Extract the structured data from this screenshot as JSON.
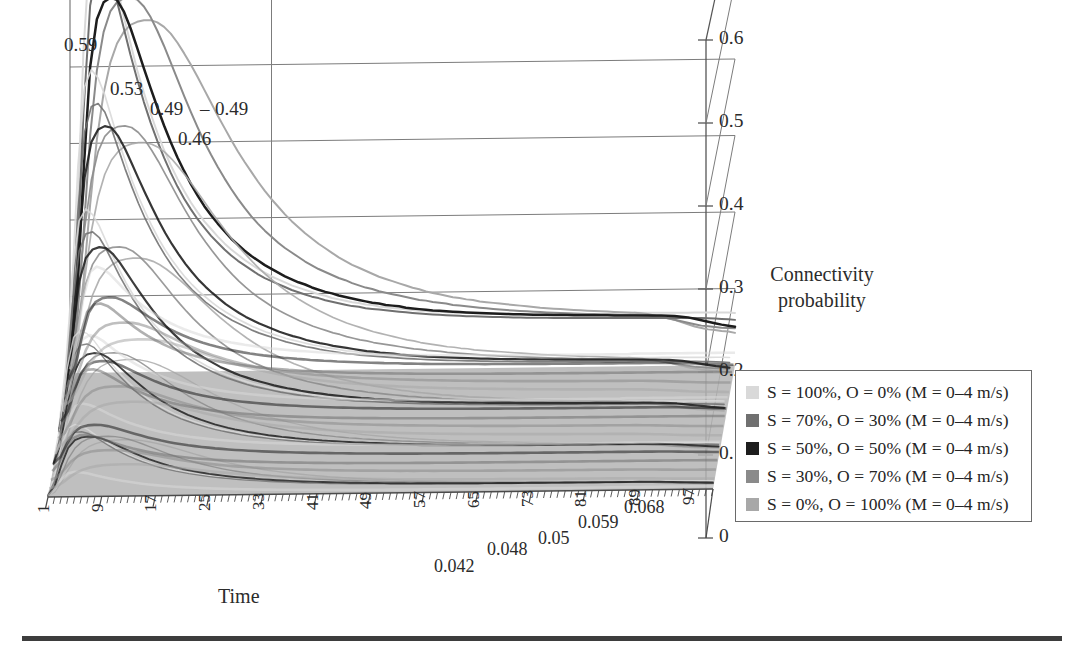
{
  "chart_data": {
    "type": "line",
    "title": "",
    "subtitle": "",
    "xlabel": "Time",
    "ylabel": "Connectivity probability",
    "zlabel": "",
    "projection": "3d-ribbon",
    "grid": true,
    "legend_position": "right",
    "ylim": [
      0,
      0.6
    ],
    "yticks": [
      "0",
      "0.1",
      "0.2",
      "0.3",
      "0.4",
      "0.5",
      "0.6"
    ],
    "ytick_values": [
      0,
      0.1,
      0.2,
      0.3,
      0.4,
      0.5,
      0.6
    ],
    "xticks": [
      "1",
      "9",
      "17",
      "25",
      "33",
      "41",
      "49",
      "57",
      "65",
      "73",
      "81",
      "89",
      "97"
    ],
    "xtick_values": [
      1,
      9,
      17,
      25,
      33,
      41,
      49,
      57,
      65,
      73,
      81,
      89,
      97
    ],
    "xlim": [
      1,
      100
    ],
    "peak_labels": [
      "0.59",
      "0.53",
      "0.49",
      "0.49",
      "0.46"
    ],
    "end_labels": [
      "0.042",
      "0.048",
      "0.05",
      "0.059",
      "0.068"
    ],
    "series": [
      {
        "name": "S = 100%, O = 0% (M = 0-4 m/s)",
        "color": "#d9d9d9",
        "peak": 0.59,
        "peak_time": 5,
        "end_value": 0.068,
        "values": [
          0.02,
          0.18,
          0.42,
          0.56,
          0.59,
          0.575,
          0.545,
          0.505,
          0.465,
          0.43,
          0.395,
          0.365,
          0.338,
          0.313,
          0.29,
          0.27,
          0.252,
          0.236,
          0.221,
          0.208,
          0.196,
          0.186,
          0.176,
          0.167,
          0.159,
          0.152,
          0.145,
          0.139,
          0.133,
          0.128,
          0.123,
          0.119,
          0.115,
          0.111,
          0.108,
          0.105,
          0.102,
          0.099,
          0.097,
          0.094,
          0.092,
          0.09,
          0.088,
          0.087,
          0.085,
          0.084,
          0.082,
          0.081,
          0.08,
          0.079,
          0.078,
          0.077,
          0.076,
          0.0755,
          0.0748,
          0.0742,
          0.0736,
          0.0731,
          0.0726,
          0.0721,
          0.0717,
          0.0713,
          0.0709,
          0.0706,
          0.0703,
          0.07,
          0.0697,
          0.0694,
          0.0692,
          0.069,
          0.0688,
          0.0686,
          0.0684,
          0.0682,
          0.0681,
          0.0679,
          0.0678,
          0.0677,
          0.0676,
          0.0675,
          0.0674,
          0.0673,
          0.0672,
          0.0671,
          0.0701,
          0.0699,
          0.0698,
          0.0697,
          0.0696,
          0.0695,
          0.0694,
          0.0693,
          0.0692,
          0.0691,
          0.069,
          0.0689,
          0.0688,
          0.0687,
          0.0686,
          0.068
        ]
      },
      {
        "name": "S = 70%, O = 30% (M = 0-4 m/s)",
        "color": "#707070",
        "peak": 0.53,
        "peak_time": 6,
        "end_value": 0.059,
        "values": [
          0.015,
          0.13,
          0.34,
          0.48,
          0.525,
          0.53,
          0.515,
          0.485,
          0.45,
          0.415,
          0.383,
          0.353,
          0.326,
          0.302,
          0.28,
          0.26,
          0.242,
          0.226,
          0.212,
          0.199,
          0.188,
          0.177,
          0.168,
          0.159,
          0.151,
          0.144,
          0.138,
          0.132,
          0.126,
          0.121,
          0.117,
          0.113,
          0.109,
          0.105,
          0.102,
          0.099,
          0.096,
          0.094,
          0.091,
          0.089,
          0.087,
          0.085,
          0.083,
          0.082,
          0.08,
          0.079,
          0.078,
          0.077,
          0.076,
          0.075,
          0.074,
          0.073,
          0.0722,
          0.0715,
          0.0708,
          0.0702,
          0.0696,
          0.0691,
          0.0686,
          0.0681,
          0.0677,
          0.0673,
          0.0669,
          0.0666,
          0.0663,
          0.066,
          0.0657,
          0.0654,
          0.0652,
          0.065,
          0.0648,
          0.0646,
          0.0644,
          0.0642,
          0.0641,
          0.0639,
          0.0638,
          0.0637,
          0.0636,
          0.0635,
          0.0634,
          0.0633,
          0.0632,
          0.0631,
          0.063,
          0.0629,
          0.0628,
          0.0627,
          0.0626,
          0.0625,
          0.0624,
          0.0623,
          0.0622,
          0.0621,
          0.062,
          0.0615,
          0.061,
          0.0605,
          0.06,
          0.059
        ]
      },
      {
        "name": "S = 50%, O = 50% (M = 0-4 m/s)",
        "color": "#1d1d1d",
        "peak": 0.49,
        "peak_time": 8,
        "end_value": 0.05,
        "values": [
          0.01,
          0.09,
          0.26,
          0.4,
          0.462,
          0.484,
          0.49,
          0.487,
          0.472,
          0.45,
          0.424,
          0.397,
          0.371,
          0.346,
          0.322,
          0.3,
          0.28,
          0.262,
          0.245,
          0.23,
          0.216,
          0.204,
          0.193,
          0.183,
          0.173,
          0.165,
          0.157,
          0.15,
          0.144,
          0.138,
          0.133,
          0.128,
          0.123,
          0.119,
          0.115,
          0.112,
          0.108,
          0.105,
          0.102,
          0.1,
          0.097,
          0.095,
          0.093,
          0.091,
          0.089,
          0.087,
          0.086,
          0.084,
          0.083,
          0.082,
          0.08,
          0.079,
          0.078,
          0.077,
          0.076,
          0.0755,
          0.0748,
          0.0741,
          0.0735,
          0.0729,
          0.0724,
          0.0719,
          0.0714,
          0.071,
          0.0706,
          0.0702,
          0.0699,
          0.0696,
          0.0693,
          0.069,
          0.0687,
          0.0685,
          0.0683,
          0.0681,
          0.0679,
          0.0677,
          0.0675,
          0.0673,
          0.0672,
          0.067,
          0.0669,
          0.0667,
          0.0666,
          0.0665,
          0.0664,
          0.0663,
          0.0662,
          0.0661,
          0.066,
          0.0655,
          0.065,
          0.064,
          0.063,
          0.061,
          0.059,
          0.057,
          0.055,
          0.053,
          0.0515,
          0.05
        ]
      },
      {
        "name": "S = 30%, O = 70% (M = 0-4 m/s)",
        "color": "#8a8a8a",
        "peak": 0.49,
        "peak_time": 11,
        "end_value": 0.048,
        "values": [
          0.008,
          0.06,
          0.18,
          0.31,
          0.395,
          0.445,
          0.472,
          0.484,
          0.489,
          0.49,
          0.487,
          0.478,
          0.464,
          0.446,
          0.426,
          0.404,
          0.382,
          0.36,
          0.339,
          0.319,
          0.3,
          0.283,
          0.267,
          0.252,
          0.238,
          0.225,
          0.213,
          0.202,
          0.192,
          0.183,
          0.175,
          0.167,
          0.16,
          0.154,
          0.148,
          0.142,
          0.137,
          0.132,
          0.128,
          0.124,
          0.12,
          0.117,
          0.113,
          0.11,
          0.107,
          0.105,
          0.102,
          0.1,
          0.098,
          0.096,
          0.094,
          0.092,
          0.09,
          0.089,
          0.087,
          0.086,
          0.085,
          0.083,
          0.082,
          0.081,
          0.08,
          0.079,
          0.078,
          0.077,
          0.0762,
          0.0754,
          0.0747,
          0.074,
          0.0734,
          0.0728,
          0.0722,
          0.0717,
          0.0712,
          0.0707,
          0.0703,
          0.0699,
          0.0695,
          0.0691,
          0.0688,
          0.0685,
          0.0682,
          0.0679,
          0.0676,
          0.0673,
          0.067,
          0.0665,
          0.066,
          0.065,
          0.064,
          0.062,
          0.06,
          0.058,
          0.056,
          0.054,
          0.052,
          0.051,
          0.05,
          0.049,
          0.0485,
          0.048
        ]
      },
      {
        "name": "S = 0%, O = 100% (M = 0-4 m/s)",
        "color": "#a8a8a8",
        "peak": 0.46,
        "peak_time": 14,
        "end_value": 0.042,
        "values": [
          0.005,
          0.04,
          0.12,
          0.22,
          0.305,
          0.365,
          0.405,
          0.43,
          0.445,
          0.454,
          0.458,
          0.46,
          0.46,
          0.457,
          0.451,
          0.442,
          0.43,
          0.416,
          0.401,
          0.385,
          0.368,
          0.351,
          0.334,
          0.318,
          0.302,
          0.287,
          0.273,
          0.26,
          0.247,
          0.235,
          0.224,
          0.214,
          0.204,
          0.195,
          0.187,
          0.179,
          0.172,
          0.165,
          0.159,
          0.153,
          0.147,
          0.142,
          0.137,
          0.133,
          0.129,
          0.125,
          0.121,
          0.118,
          0.115,
          0.112,
          0.109,
          0.106,
          0.104,
          0.101,
          0.099,
          0.097,
          0.095,
          0.093,
          0.092,
          0.09,
          0.089,
          0.087,
          0.086,
          0.085,
          0.084,
          0.083,
          0.082,
          0.081,
          0.08,
          0.079,
          0.078,
          0.0772,
          0.0765,
          0.0758,
          0.0751,
          0.0745,
          0.0739,
          0.0733,
          0.0728,
          0.0723,
          0.0718,
          0.0713,
          0.0708,
          0.0703,
          0.0698,
          0.069,
          0.068,
          0.066,
          0.064,
          0.062,
          0.06,
          0.057,
          0.054,
          0.051,
          0.049,
          0.047,
          0.046,
          0.0448,
          0.0438,
          0.042
        ]
      }
    ]
  },
  "legend": {
    "items": [
      {
        "label": "S = 100%, O = 0% (M = 0–4 m/s)",
        "color": "#d9d9d9"
      },
      {
        "label": "S = 70%, O = 30% (M = 0–4 m/s)",
        "color": "#707070"
      },
      {
        "label": "S = 50%, O = 50% (M = 0–4 m/s)",
        "color": "#1d1d1d"
      },
      {
        "label": "S = 30%, O = 70% (M = 0–4 m/s)",
        "color": "#8a8a8a"
      },
      {
        "label": "S = 0%, O = 100% (M = 0–4 m/s)",
        "color": "#a8a8a8"
      }
    ]
  },
  "axes": {
    "y_title_line1": "Connectivity",
    "y_title_line2": "probability",
    "x_title": "Time",
    "yticks": [
      "0.6",
      "0.5",
      "0.4",
      "0.3",
      "0.2",
      "0.1",
      "0"
    ],
    "xticks": [
      "1",
      "9",
      "17",
      "25",
      "33",
      "41",
      "49",
      "57",
      "65",
      "73",
      "81",
      "89",
      "97"
    ]
  },
  "annotations": {
    "peaks": [
      "0.59",
      "0.53",
      "0.49",
      "0.49",
      "0.46"
    ],
    "ends": [
      "0.042",
      "0.048",
      "0.05",
      "0.059",
      "0.068"
    ]
  }
}
